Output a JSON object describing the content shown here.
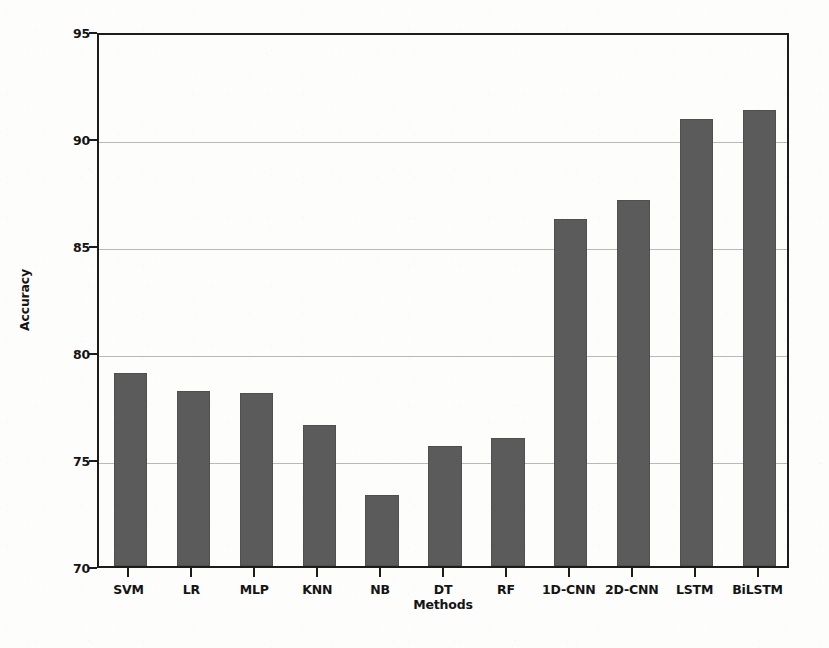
{
  "chart_data": {
    "type": "bar",
    "title": "",
    "xlabel": "Methods",
    "ylabel": "Accuracy",
    "categories": [
      "SVM",
      "LR",
      "MLP",
      "KNN",
      "NB",
      "DT",
      "RF",
      "1D-CNN",
      "2D-CNN",
      "LSTM",
      "BiLSTM"
    ],
    "values": [
      79.0,
      78.2,
      78.1,
      76.6,
      73.3,
      75.6,
      76.0,
      86.2,
      87.1,
      90.9,
      91.3
    ],
    "series": [
      {
        "name": "Accuracy",
        "values": [
          79.0,
          78.2,
          78.1,
          76.6,
          73.3,
          75.6,
          76.0,
          86.2,
          87.1,
          90.9,
          91.3
        ]
      }
    ],
    "ylim": [
      70,
      95
    ],
    "yticks": [
      70,
      75,
      80,
      85,
      90,
      95
    ],
    "ytick_labels": [
      "70",
      "75",
      "80",
      "85",
      "90",
      "95"
    ],
    "grid": true,
    "grid_axis": "y",
    "legend": false,
    "legend_position": "none",
    "bar_color": "#5b5b5b",
    "grid_color": "#b9b9b9",
    "axis_color": "#1c1c1c",
    "background_color": "#fdfdfc"
  }
}
